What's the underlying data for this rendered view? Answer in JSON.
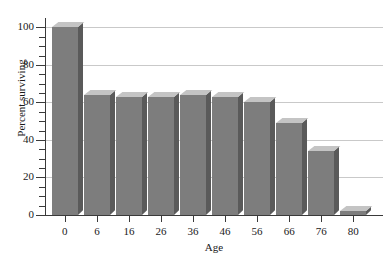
{
  "chart_data": {
    "type": "bar",
    "title": "",
    "subtitle": "",
    "xlabel": "Age",
    "ylabel": "Percent surviving",
    "categories": [
      "0",
      "6",
      "16",
      "26",
      "36",
      "46",
      "56",
      "66",
      "76",
      "80"
    ],
    "values": [
      100,
      64,
      63,
      63,
      64,
      63,
      60,
      49,
      34,
      2
    ],
    "series": [
      {
        "name": "Percent surviving",
        "values": [
          100,
          64,
          63,
          63,
          64,
          63,
          60,
          49,
          34,
          2
        ]
      }
    ],
    "ylim": [
      0,
      105
    ],
    "y_major_ticks": [
      0,
      20,
      40,
      60,
      80,
      100
    ],
    "y_minor_tick_step": 5,
    "y_tick_labels": [
      "0",
      "20",
      "40",
      "60",
      "80",
      "100"
    ],
    "x_tick_labels": [
      "0",
      "6",
      "16",
      "26",
      "36",
      "46",
      "56",
      "66",
      "76",
      "80"
    ],
    "grid": true,
    "grid_values": [
      20,
      40,
      60,
      80,
      100
    ],
    "legend": "none",
    "legend_position": "none",
    "bar_style": "3d",
    "colors": {
      "bar_front": "#7d7d7d",
      "bar_top": "#c4c4c4",
      "bar_side": "#5a5a5a",
      "gridline": "#c9c9c9",
      "axis": "#3a3a3a",
      "text": "#1a1a1a",
      "background": "#ffffff"
    },
    "annotations": []
  }
}
